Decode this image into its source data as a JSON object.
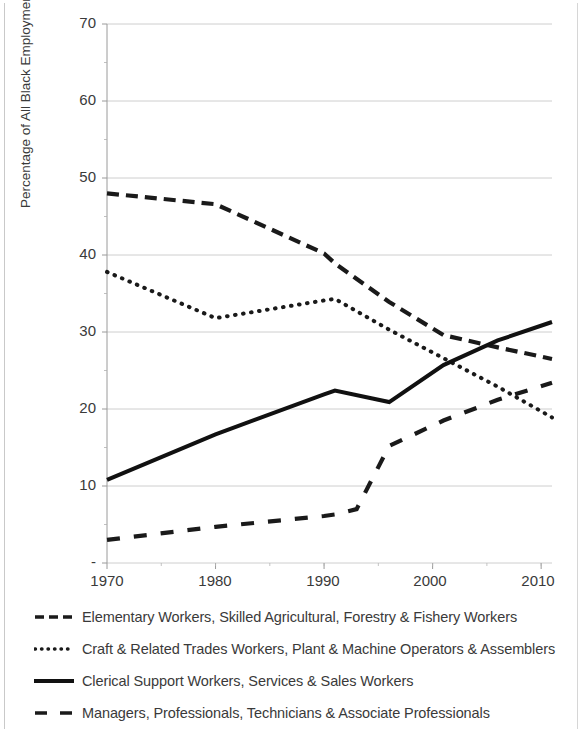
{
  "chart_data": {
    "type": "line",
    "title": "",
    "xlabel": "",
    "ylabel": "Percentage of All Black Employment",
    "xlim": [
      1970,
      2011
    ],
    "ylim": [
      0,
      70
    ],
    "xticks": [
      "1970",
      "1980",
      "1990",
      "2000",
      "2010"
    ],
    "xtick_values": [
      1970,
      1980,
      1990,
      2000,
      2010
    ],
    "yticks": [
      "-",
      "10",
      "20",
      "30",
      "40",
      "50",
      "60",
      "70"
    ],
    "ytick_values": [
      0,
      10,
      20,
      30,
      40,
      50,
      60,
      70
    ],
    "grid": true,
    "grid_axis": "y",
    "legend_position": "below",
    "series": [
      {
        "name": "Elementary Workers, Skilled Agricultural, Forestry & Fishery Workers",
        "style": "dashed",
        "color": "#1a1a1a",
        "x": [
          1970,
          1980,
          1990,
          1991,
          1996,
          2001,
          2006,
          2011
        ],
        "values": [
          48.0,
          46.6,
          40.2,
          38.9,
          33.9,
          29.6,
          28.0,
          26.5
        ]
      },
      {
        "name": "Craft & Related Trades Workers, Plant & Machine Operators & Assemblers",
        "style": "dotted",
        "color": "#1a1a1a",
        "x": [
          1970,
          1980,
          1990,
          1991,
          1996,
          2001,
          2006,
          2011
        ],
        "values": [
          37.8,
          31.8,
          34.1,
          34.3,
          30.3,
          26.6,
          22.9,
          18.9
        ]
      },
      {
        "name": "Clerical Support Workers, Services & Sales Workers",
        "style": "solid",
        "color": "#111111",
        "x": [
          1970,
          1980,
          1990,
          1991,
          1996,
          2001,
          2006,
          2011
        ],
        "values": [
          10.8,
          16.7,
          21.9,
          22.4,
          20.9,
          25.7,
          28.9,
          31.3
        ]
      },
      {
        "name": "Managers, Professionals, Technicians & Associate Professionals",
        "style": "dashed-long",
        "color": "#1a1a1a",
        "x": [
          1970,
          1980,
          1990,
          1991,
          1993,
          1996,
          2001,
          2006,
          2011
        ],
        "values": [
          3.0,
          4.7,
          6.1,
          6.3,
          7.0,
          15.2,
          18.5,
          21.2,
          23.4
        ]
      }
    ]
  },
  "legend": {
    "items": [
      {
        "label": "Elementary Workers, Skilled Agricultural, Forestry & Fishery Workers",
        "style": "dashed"
      },
      {
        "label": "Craft & Related Trades Workers, Plant & Machine Operators & Assemblers",
        "style": "dotted"
      },
      {
        "label": "Clerical Support Workers, Services & Sales Workers",
        "style": "solid"
      },
      {
        "label": "Managers, Professionals, Technicians & Associate Professionals",
        "style": "dashed-long"
      }
    ]
  },
  "axis": {
    "y_label": "Percentage of All Black Employment",
    "y_tick_0": "-",
    "y_tick_10": "10",
    "y_tick_20": "20",
    "y_tick_30": "30",
    "y_tick_40": "40",
    "y_tick_50": "50",
    "y_tick_60": "60",
    "y_tick_70": "70",
    "x_tick_1970": "1970",
    "x_tick_1980": "1980",
    "x_tick_1990": "1990",
    "x_tick_2000": "2000",
    "x_tick_2010": "2010"
  }
}
